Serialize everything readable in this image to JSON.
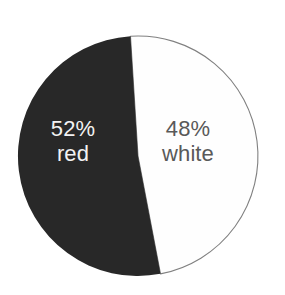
{
  "chart_data": {
    "type": "pie",
    "title": "",
    "subtitle": "",
    "xlabel": "",
    "ylabel": "",
    "grid": false,
    "legend_position": "inside-slices",
    "units": "percent",
    "total": 100,
    "start_angle_deg": -3.6,
    "direction": "counterclockwise",
    "categories": [
      "red",
      "white"
    ],
    "values": [
      52,
      48
    ],
    "labels": [
      "52% red",
      "48% white"
    ],
    "colors": [
      "#282828",
      "#fefefe"
    ],
    "slices": [
      {
        "name": "red",
        "label": "red",
        "percent": 52,
        "percent_text": "52%",
        "color": "#282828",
        "stroke": "none",
        "text_color": "#f2f2f2"
      },
      {
        "name": "white",
        "label": "white",
        "percent": 48,
        "percent_text": "48%",
        "color": "#fefefe",
        "stroke": "#808080",
        "text_color": "#595959"
      }
    ]
  },
  "figure": {
    "background": "#ffffff",
    "center_x": 138,
    "center_y": 156,
    "radius": 120,
    "outline_color": "#808080"
  }
}
